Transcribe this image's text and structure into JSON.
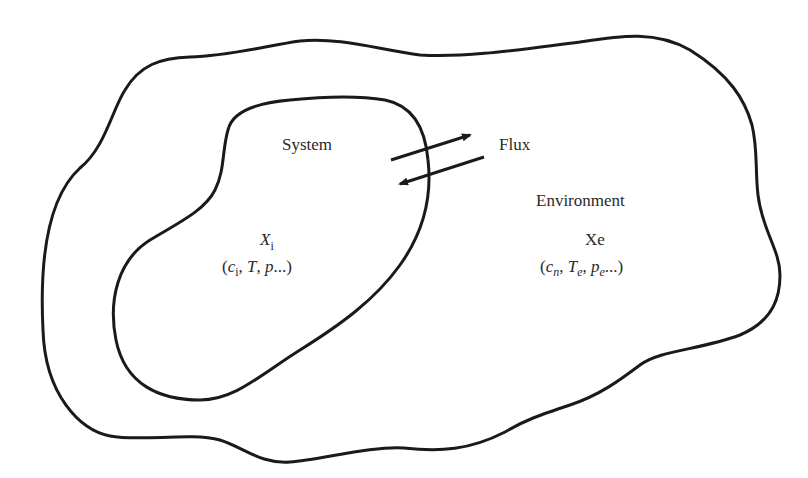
{
  "diagram": {
    "type": "system-environment boundary diagram",
    "regions": {
      "environment": {
        "label": "Environment",
        "state_symbol": "Xe",
        "variables": {
          "open": "(",
          "c": "c",
          "c_sub": "n",
          "sep1": ", ",
          "T": "T",
          "T_sub": "e",
          "sep2": ", ",
          "p": "p",
          "p_sub": "e",
          "ellipsis": "...",
          "close": ")"
        }
      },
      "system": {
        "label": "System",
        "state_symbol": "X",
        "state_sub": "i",
        "variables": {
          "open": "(",
          "c": "c",
          "c_sub": "i",
          "sep1": ", ",
          "T": "T",
          "sep2": ", ",
          "p": "p",
          "ellipsis": "...",
          "close": ")"
        }
      }
    },
    "exchange": {
      "label": "Flux",
      "arrows": [
        {
          "direction": "system-to-environment"
        },
        {
          "direction": "environment-to-system"
        }
      ]
    },
    "colors": {
      "stroke": "#1a1a1a",
      "text": "#2a2a2a",
      "background": "#ffffff"
    }
  }
}
